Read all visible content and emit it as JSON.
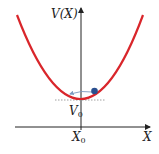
{
  "diagram": {
    "labels": {
      "y_axis": "V(X)",
      "x_axis": "X",
      "min_potential": "V",
      "min_potential_sub": "0",
      "equilibrium": "X",
      "equilibrium_sub": "0"
    },
    "colors": {
      "curve": "#d9262b",
      "ball": "#2a4f8f",
      "axes": "#222222",
      "dashed": "#888888",
      "arrow": "#7a9ac0"
    },
    "elements": [
      "parabolic potential curve",
      "ball on curve",
      "motion arrow",
      "dashed minimum line"
    ]
  }
}
